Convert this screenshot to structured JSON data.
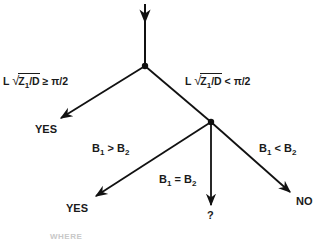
{
  "diagram": {
    "type": "decision-tree",
    "stroke_color": "#111111",
    "background": "#ffffff",
    "nodes": [
      {
        "id": "root-node",
        "x": 145,
        "y": 66
      },
      {
        "id": "b-compare-node",
        "x": 211,
        "y": 122
      }
    ],
    "conditions": {
      "left_top": {
        "prefix": "L",
        "radicand": "Z",
        "radicand_sub": "1",
        "radicand_tail": "/D",
        "op": "≥",
        "rhs": "π/2"
      },
      "right_top": {
        "prefix": "L",
        "radicand": "Z",
        "radicand_sub": "1",
        "radicand_tail": "/D",
        "op": "<",
        "rhs": "π/2"
      },
      "b_greater": {
        "a": "B",
        "a_sub": "1",
        "op": ">",
        "b": "B",
        "b_sub": "2"
      },
      "b_equal": {
        "a": "B",
        "a_sub": "1",
        "op": "=",
        "b": "B",
        "b_sub": "2"
      },
      "b_less": {
        "a": "B",
        "a_sub": "1",
        "op": "<",
        "b": "B",
        "b_sub": "2"
      }
    },
    "outcomes": {
      "top_left": "YES",
      "bottom_left": "YES",
      "bottom_middle": "?",
      "bottom_right": "NO"
    },
    "footer_partial": "WHERE"
  }
}
